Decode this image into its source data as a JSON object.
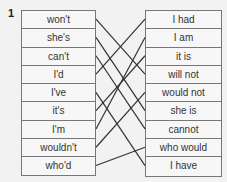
{
  "exercise": {
    "number": "1",
    "left_items": [
      "won't",
      "she's",
      "can't",
      "I'd",
      "I've",
      "it's",
      "I'm",
      "wouldn't",
      "who'd"
    ],
    "right_items": [
      "I had",
      "I am",
      "it is",
      "will not",
      "would not",
      "she is",
      "cannot",
      "who would",
      "I have"
    ],
    "matches": [
      {
        "left": "won't",
        "right": "will not"
      },
      {
        "left": "she's",
        "right": "she is"
      },
      {
        "left": "can't",
        "right": "cannot"
      },
      {
        "left": "I'd",
        "right": "I had"
      },
      {
        "left": "I've",
        "right": "I have"
      },
      {
        "left": "it's",
        "right": "it is"
      },
      {
        "left": "I'm",
        "right": "I am"
      },
      {
        "left": "wouldn't",
        "right": "would not"
      },
      {
        "left": "who'd",
        "right": "who would"
      }
    ]
  },
  "colors": {
    "background": "#f2f2f2",
    "border": "#777777",
    "line": "#333333",
    "text": "#333333"
  }
}
